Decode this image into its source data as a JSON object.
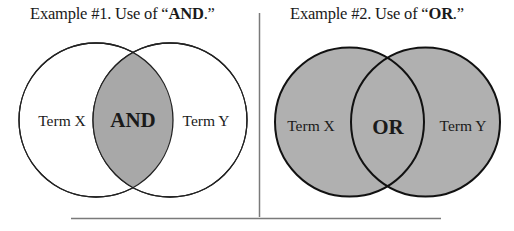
{
  "example1": {
    "caption_prefix": "Example #1.  Use of “",
    "caption_keyword": "AND",
    "caption_suffix": ".”",
    "term_left": "Term X",
    "term_right": "Term Y",
    "operator": "AND",
    "shading": "intersection-only",
    "fill_color": "#a8a8a8",
    "stroke_color": "#222222"
  },
  "example2": {
    "caption_prefix": "Example #2.  Use of “",
    "caption_keyword": "OR",
    "caption_suffix": ".”",
    "term_left": "Term X",
    "term_right": "Term Y",
    "operator": "OR",
    "shading": "union",
    "fill_color": "#b0b0b0",
    "stroke_color": "#111111"
  },
  "colors": {
    "background": "#ffffff",
    "divider": "#7a7a7a",
    "text": "#1a1a1a"
  }
}
